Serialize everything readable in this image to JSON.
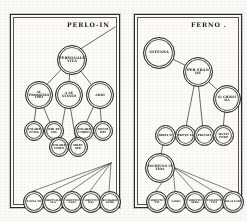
{
  "document": {
    "kind": "scanned-diagram",
    "ink_color": "#25241f",
    "paper_color": "#fbfaf6"
  },
  "panels": [
    {
      "id": "left",
      "title": "PERLO-IN",
      "nodes": [
        {
          "id": "L-root",
          "label": "PERSONALE VITA",
          "x": 46,
          "y": 30,
          "d": 28,
          "size": "big"
        },
        {
          "id": "L-m1",
          "label": "AL PROSSIMO IPIO",
          "x": 14,
          "y": 66,
          "d": 26,
          "size": ""
        },
        {
          "id": "L-m2",
          "label": "A SE STESSO",
          "x": 44,
          "y": 66,
          "d": 26,
          "size": ""
        },
        {
          "id": "L-m3",
          "label": "ADIO",
          "x": 75,
          "y": 66,
          "d": 26,
          "size": ""
        },
        {
          "id": "L-s1",
          "label": "SOLARE COMA",
          "x": 13,
          "y": 106,
          "d": 18,
          "size": "sm"
        },
        {
          "id": "L-s2",
          "label": "DIR EX SOL",
          "x": 33,
          "y": 106,
          "d": 18,
          "size": "sm"
        },
        {
          "id": "L-s3",
          "label": "SOLARE CORPO",
          "x": 63,
          "y": 106,
          "d": 18,
          "size": "sm"
        },
        {
          "id": "L-s4",
          "label": "MULTI DEI",
          "x": 82,
          "y": 106,
          "d": 18,
          "size": "sm"
        },
        {
          "id": "L-s5",
          "label": "SOLARE COMO",
          "x": 38,
          "y": 122,
          "d": 18,
          "size": "sm"
        },
        {
          "id": "L-s6",
          "label": "SIREC SEE",
          "x": 57,
          "y": 122,
          "d": 18,
          "size": "sm"
        },
        {
          "id": "L-b1",
          "label": "POTTA TE",
          "x": 12,
          "y": 176,
          "d": 20,
          "size": "xs"
        },
        {
          "id": "L-b2",
          "label": "SIRITUALE VLA",
          "x": 31,
          "y": 176,
          "d": 20,
          "size": "xs"
        },
        {
          "id": "L-b3",
          "label": "SERVITII NATI",
          "x": 50,
          "y": 176,
          "d": 20,
          "size": "xs"
        },
        {
          "id": "L-b4",
          "label": "SERVITII DEI",
          "x": 69,
          "y": 176,
          "d": 20,
          "size": "xs"
        },
        {
          "id": "L-b5",
          "label": "RICHARDI ALTRI",
          "x": 88,
          "y": 176,
          "d": 20,
          "size": "xs"
        }
      ],
      "links": [
        {
          "from": "L-root",
          "to": "L-m1"
        },
        {
          "from": "L-root",
          "to": "L-m2"
        },
        {
          "from": "L-root",
          "to": "L-m3"
        },
        {
          "from": "L-m1",
          "to": "L-s1"
        },
        {
          "from": "L-m1",
          "to": "L-s2"
        },
        {
          "from": "L-m2",
          "to": "L-s5"
        },
        {
          "from": "L-m2",
          "to": "L-s6"
        },
        {
          "from": "L-m3",
          "to": "L-s3"
        },
        {
          "from": "L-m3",
          "to": "L-s4"
        }
      ],
      "corner_line": {
        "from": "L-root",
        "to_edge": "top-right"
      },
      "fan": {
        "origin_x": 100,
        "origin_y": 148,
        "targets": [
          "L-b1",
          "L-b2",
          "L-b3",
          "L-b4",
          "L-b5"
        ]
      }
    },
    {
      "id": "right",
      "title": "FERNO .",
      "nodes": [
        {
          "id": "R-a",
          "label": "INTENSA",
          "x": 8,
          "y": 22,
          "d": 30,
          "size": "big"
        },
        {
          "id": "R-b",
          "label": "PER FRAN DE",
          "x": 48,
          "y": 42,
          "d": 28,
          "size": "big"
        },
        {
          "id": "R-c",
          "label": "SI CHISSI DA",
          "x": 78,
          "y": 70,
          "d": 26,
          "size": ""
        },
        {
          "id": "R-m1",
          "label": "DIREI TI",
          "x": 20,
          "y": 110,
          "d": 19,
          "size": "sm"
        },
        {
          "id": "R-m2",
          "label": "PROTE IA",
          "x": 40,
          "y": 110,
          "d": 19,
          "size": "sm"
        },
        {
          "id": "R-m3",
          "label": "PRIVATI",
          "x": 59,
          "y": 110,
          "d": 19,
          "size": "sm"
        },
        {
          "id": "R-m4",
          "label": "MULTI CORO",
          "x": 78,
          "y": 110,
          "d": 19,
          "size": "sm"
        },
        {
          "id": "R-hub",
          "label": "INCHIUSO SI FIDA",
          "x": 10,
          "y": 138,
          "d": 28,
          "size": ""
        },
        {
          "id": "R-b1",
          "label": "SERVITII TTI",
          "x": 11,
          "y": 176,
          "d": 20,
          "size": "xs"
        },
        {
          "id": "R-b2",
          "label": "LADRI",
          "x": 30,
          "y": 176,
          "d": 20,
          "size": "xs"
        },
        {
          "id": "R-b3",
          "label": "SERVITII APRO",
          "x": 49,
          "y": 176,
          "d": 20,
          "size": "xs"
        },
        {
          "id": "R-b4",
          "label": "VIOLENTI TIGI",
          "x": 68,
          "y": 176,
          "d": 20,
          "size": "xs"
        },
        {
          "id": "R-b5",
          "label": "FALSI FORI",
          "x": 87,
          "y": 176,
          "d": 20,
          "size": "xs"
        }
      ],
      "links": [
        {
          "from": "R-a",
          "to": "R-b"
        },
        {
          "from": "R-b",
          "to": "R-c"
        },
        {
          "from": "R-b",
          "to": "R-m3"
        },
        {
          "from": "R-c",
          "to": "R-m4"
        },
        {
          "from": "R-b",
          "to": "R-m2"
        },
        {
          "from": "R-m1",
          "to": "R-hub"
        },
        {
          "from": "R-m2",
          "to": "R-m1"
        }
      ],
      "fan": {
        "origin_x": 38,
        "origin_y": 152,
        "targets": [
          "R-b1",
          "R-b2",
          "R-b3",
          "R-b4",
          "R-b5"
        ]
      }
    }
  ]
}
